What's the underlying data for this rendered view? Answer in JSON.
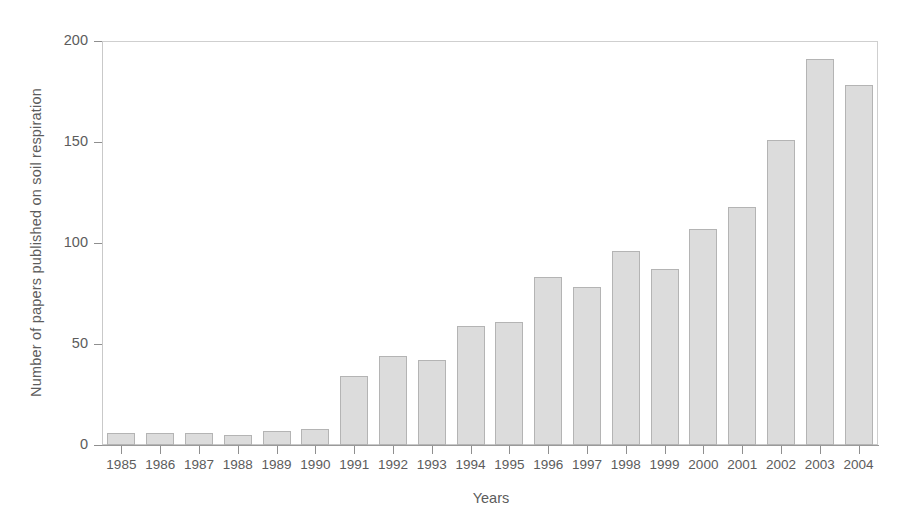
{
  "chart_data": {
    "type": "bar",
    "title": "",
    "subtitle": "",
    "xlabel": "Years",
    "ylabel": "Number of papers published on soil respiration",
    "categories": [
      "1985",
      "1986",
      "1987",
      "1988",
      "1989",
      "1990",
      "1991",
      "1992",
      "1993",
      "1994",
      "1995",
      "1996",
      "1997",
      "1998",
      "1999",
      "2000",
      "2001",
      "2002",
      "2003",
      "2004"
    ],
    "values": [
      6,
      6,
      6,
      5,
      7,
      8,
      34,
      44,
      42,
      59,
      61,
      83,
      78,
      96,
      87,
      107,
      118,
      151,
      191,
      178
    ],
    "series": [
      {
        "name": "Number of papers published on soil respiration",
        "values": [
          6,
          6,
          6,
          5,
          7,
          8,
          34,
          44,
          42,
          59,
          61,
          83,
          78,
          96,
          87,
          107,
          118,
          151,
          191,
          178
        ]
      }
    ],
    "ylim": [
      0,
      200
    ],
    "yticks": [
      0,
      50,
      100,
      150,
      200
    ],
    "ytick_labels": [
      "0",
      "50",
      "100",
      "150",
      "200"
    ],
    "xtick_labels": [
      "1985",
      "1986",
      "1987",
      "1988",
      "1989",
      "1990",
      "1991",
      "1992",
      "1993",
      "1994",
      "1995",
      "1996",
      "1997",
      "1998",
      "1999",
      "2000",
      "2001",
      "2002",
      "2003",
      "2004"
    ],
    "grid": false,
    "legend": false,
    "legend_position": "none",
    "bar_fill_color": "#dcdcdc",
    "bar_edge_color": "#b4b4b4",
    "axis_color": "#9a9a9a",
    "text_color": "#5c5c5c",
    "background_color": "#ffffff",
    "annotations": []
  }
}
